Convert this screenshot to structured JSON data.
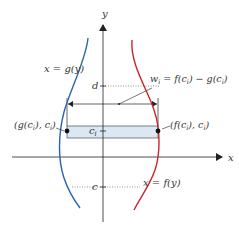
{
  "diagram": {
    "axes": {
      "x_label": "x",
      "y_label": "y"
    },
    "ticks": {
      "d": "d",
      "c": "c",
      "ci": "c",
      "ci_sub": "i"
    },
    "curves": {
      "left": {
        "label_pre": "x = g(y)",
        "color": "#2a63b0"
      },
      "right": {
        "label_pre": "x = f(y)",
        "color": "#c6262e"
      }
    },
    "width_label": "w",
    "width_label_sub": "i",
    "width_label_rest": " = f(c",
    "width_label_rest2": ") − g(c",
    "width_label_end": ")",
    "points": {
      "left": {
        "p1": "(g(c",
        "p2": "), c",
        "p3": ")"
      },
      "right": {
        "p1": "(f(c",
        "p2": "), c",
        "p3": ")"
      }
    },
    "colors": {
      "strip_fill": "#dbe8f3",
      "axis": "#222222",
      "dotted": "#666666"
    }
  }
}
